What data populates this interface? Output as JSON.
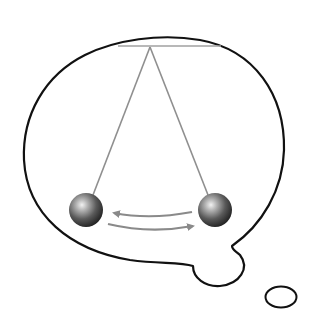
{
  "figure": {
    "width": 310,
    "height": 315,
    "colors": {
      "background": "#ffffff",
      "bubble_outline": "#111111",
      "string": "#8f8f8f",
      "support_bar": "#a0a0a0",
      "arrow": "#8a8a8a",
      "ball_dark": "#1e1e1e",
      "ball_mid": "#6a6a6a",
      "ball_highlight": "#f2f2f2"
    },
    "pendulum": {
      "pivot": {
        "x": 150,
        "y": 47
      },
      "support_bar": {
        "x1": 118,
        "x2": 220,
        "y": 46
      },
      "balls": [
        {
          "name": "left-position",
          "cx": 86,
          "cy": 210,
          "r": 17
        },
        {
          "name": "right-position",
          "cx": 214,
          "cy": 210,
          "r": 17
        }
      ],
      "arrows": [
        {
          "name": "swing-left-arrow",
          "direction": "left"
        },
        {
          "name": "swing-right-arrow",
          "direction": "right"
        }
      ]
    },
    "thought_tail": {
      "small_bubble": {
        "cx": 281,
        "cy": 297,
        "rx": 16,
        "ry": 11
      }
    }
  }
}
